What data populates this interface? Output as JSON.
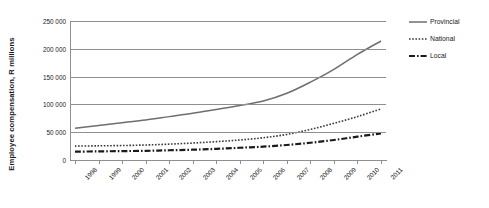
{
  "chart_data": {
    "type": "line",
    "title": "",
    "xlabel": "",
    "ylabel": "Employee compensation, R millions",
    "x": [
      "1998",
      "1999",
      "2000",
      "2001",
      "2002",
      "2003",
      "2004",
      "2005",
      "2006",
      "2007",
      "2008",
      "2009",
      "2010",
      "2011"
    ],
    "categories": [
      "1998",
      "1999",
      "2000",
      "2001",
      "2002",
      "2003",
      "2004",
      "2005",
      "2006",
      "2007",
      "2008",
      "2009",
      "2010",
      "2011"
    ],
    "ylim": [
      0,
      250000
    ],
    "yticks": [
      0,
      50000,
      100000,
      150000,
      200000,
      250000
    ],
    "ytick_labels": [
      "0",
      "50 000",
      "100 000",
      "150 000",
      "200 000",
      "250 000"
    ],
    "grid": true,
    "legend_position": "right",
    "series": [
      {
        "name": "Provincial",
        "style": "solid",
        "color": "#6e6e6e",
        "values": [
          57000,
          62000,
          67000,
          72000,
          78000,
          84000,
          91000,
          98000,
          106000,
          120000,
          140000,
          163000,
          190000,
          214000
        ]
      },
      {
        "name": "National",
        "style": "dotted",
        "color": "#3a3a3a",
        "values": [
          25000,
          25500,
          26000,
          27000,
          28500,
          30500,
          33000,
          36000,
          40000,
          46000,
          55000,
          66000,
          78000,
          92000
        ]
      },
      {
        "name": "Local",
        "style": "dashdot",
        "color": "#1a1a1a",
        "values": [
          15000,
          15500,
          16000,
          16500,
          17500,
          18500,
          20000,
          22000,
          24000,
          27000,
          31000,
          36000,
          42000,
          48000
        ]
      }
    ]
  },
  "legend": {
    "items": [
      {
        "label": "Provincial",
        "style": "solid"
      },
      {
        "label": "National",
        "style": "dotted"
      },
      {
        "label": "Local",
        "style": "dashdot"
      }
    ]
  },
  "axis": {
    "y_title": "Employee compensation, R millions"
  },
  "colors": {
    "grid": "#8f8f8f",
    "axis": "#8f8f8f",
    "text": "#1a1a1a",
    "background": "#ffffff",
    "provincial": "#6e6e6e",
    "national": "#3a3a3a",
    "local": "#1a1a1a"
  }
}
